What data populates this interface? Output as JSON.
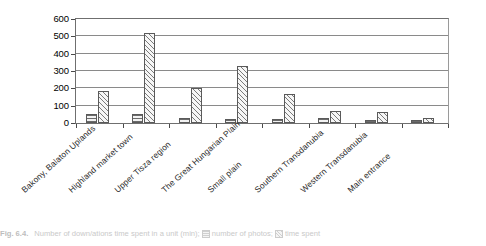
{
  "chart_data": {
    "type": "bar",
    "title": "",
    "xlabel": "",
    "ylabel": "",
    "ylim": [
      0,
      600
    ],
    "ytick_labels": [
      "600",
      "500",
      "400",
      "300",
      "200",
      "100",
      "0"
    ],
    "ytick_values": [
      600,
      500,
      400,
      300,
      200,
      100,
      0
    ],
    "grid": true,
    "legend_position": "caption",
    "categories": [
      "Bakony, Balaton Uplands",
      "Highland market town",
      "Upper Tisza region",
      "The Great Hungarian Plain",
      "Small plain",
      "Southern Transdanubia",
      "Western Transdanubia",
      "Main entrance"
    ],
    "series": [
      {
        "name": "number of photos",
        "pattern": "horizontal-hatch",
        "values": [
          50,
          50,
          30,
          25,
          25,
          30,
          20,
          18
        ]
      },
      {
        "name": "time spent",
        "pattern": "diagonal-hatch",
        "values": [
          185,
          520,
          200,
          330,
          170,
          70,
          65,
          30
        ]
      }
    ]
  },
  "caption": {
    "figure_number": "Fig. 6.4.",
    "text": "Number of down/ations time spent in a unit (min);",
    "legend_photos": "number of photos;",
    "legend_time": "time spent"
  }
}
